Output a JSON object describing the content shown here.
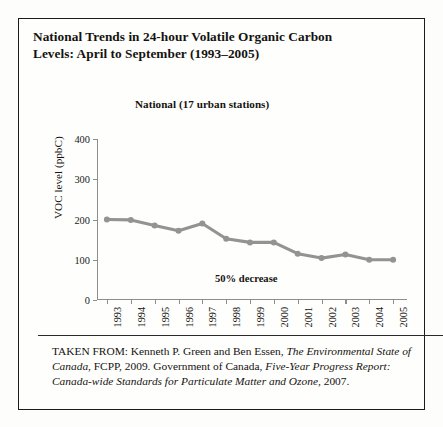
{
  "figure": {
    "title_line_1": "National Trends in 24-hour Volatile Organic Carbon",
    "title_line_2": "Levels: April to September (1993–2005)",
    "chart_subtitle": "National (17 urban stations)",
    "annotation": "50% decrease"
  },
  "source": {
    "prefix": "TAKEN FROM: Kenneth P. Green and Ben Essen, ",
    "work_1": "The Environmental State of Canada",
    "middle": ", FCPP, 2009. Government of Canada, ",
    "work_2": "Five-Year Progress Report: Canada-wide Standards for Particulate Matter and Ozone",
    "suffix": ", 2007."
  },
  "colors": {
    "series_line": "#939393",
    "axis": "#8e8e8e",
    "border": "#1b1b1b",
    "text": "#15130f",
    "page_background": "#fdfdfc"
  },
  "chart_data": {
    "type": "line",
    "title": "National (17 urban stations)",
    "xlabel": "",
    "ylabel": "VOC level (ppbC)",
    "ylim": [
      0,
      400
    ],
    "yticks": [
      0,
      100,
      200,
      300,
      400
    ],
    "ytick_labels": [
      "0",
      "100",
      "200",
      "300",
      "400"
    ],
    "grid": false,
    "legend": false,
    "annotations": [
      {
        "text": "50% decrease",
        "x": "1999",
        "y": 30
      }
    ],
    "categories": [
      "1993",
      "1994",
      "1995",
      "1996",
      "1997",
      "1998",
      "1999",
      "2000",
      "2001",
      "2002",
      "2003",
      "2004",
      "2005"
    ],
    "values": [
      200,
      199,
      185,
      172,
      190,
      152,
      143,
      143,
      115,
      104,
      113,
      100,
      100
    ],
    "series": [
      {
        "name": "National (17 urban stations)",
        "values": [
          200,
          199,
          185,
          172,
          190,
          152,
          143,
          143,
          115,
          104,
          113,
          100,
          100
        ],
        "color": "#939393",
        "marker": "circle"
      }
    ]
  }
}
